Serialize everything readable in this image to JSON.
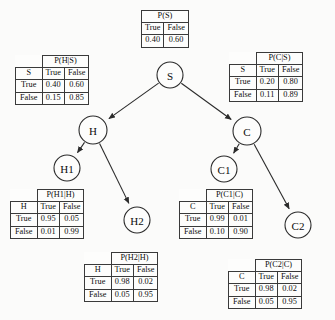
{
  "diagram": {
    "nodes": [
      {
        "id": "S",
        "label": "S",
        "cx": 170,
        "cy": 75,
        "r": 13
      },
      {
        "id": "H",
        "label": "H",
        "cx": 93,
        "cy": 130,
        "r": 14
      },
      {
        "id": "C",
        "label": "C",
        "cx": 247,
        "cy": 131,
        "r": 14
      },
      {
        "id": "H1",
        "label": "H1",
        "cx": 67,
        "cy": 168,
        "r": 13
      },
      {
        "id": "C1",
        "label": "C1",
        "cx": 224,
        "cy": 169,
        "r": 13
      },
      {
        "id": "H2",
        "label": "H2",
        "cx": 137,
        "cy": 220,
        "r": 13
      },
      {
        "id": "C2",
        "label": "C2",
        "cx": 298,
        "cy": 225,
        "r": 13
      }
    ],
    "edges": [
      {
        "from": "S",
        "to": "H"
      },
      {
        "from": "S",
        "to": "C"
      },
      {
        "from": "H",
        "to": "H1"
      },
      {
        "from": "H",
        "to": "H2"
      },
      {
        "from": "C",
        "to": "C1"
      },
      {
        "from": "C",
        "to": "C2"
      }
    ],
    "colors": {
      "stroke": "#2b2b2b",
      "node_fill": "#fdfdfc",
      "table_border": "#3a3a3a",
      "background": "#fbfbfa",
      "text": "#0d0d0d"
    }
  },
  "tables": {
    "p_s": {
      "title": "P(S)",
      "col_headers": [
        "True",
        "False"
      ],
      "values": [
        "0.40",
        "0.60"
      ]
    },
    "p_h_given_s": {
      "title": "P(H|S)",
      "parent_header": "S",
      "col_headers": [
        "True",
        "False"
      ],
      "rows": [
        {
          "label": "True",
          "values": [
            "0.40",
            "0.60"
          ]
        },
        {
          "label": "False",
          "values": [
            "0.15",
            "0.85"
          ]
        }
      ]
    },
    "p_c_given_s": {
      "title": "P(C|S)",
      "parent_header": "S",
      "col_headers": [
        "True",
        "False"
      ],
      "rows": [
        {
          "label": "True",
          "values": [
            "0.20",
            "0.80"
          ]
        },
        {
          "label": "False",
          "values": [
            "0.11",
            "0.89"
          ]
        }
      ]
    },
    "p_h1_given_h": {
      "title": "P(H1|H)",
      "parent_header": "H",
      "col_headers": [
        "True",
        "False"
      ],
      "rows": [
        {
          "label": "True",
          "values": [
            "0.95",
            "0.05"
          ]
        },
        {
          "label": "False",
          "values": [
            "0.01",
            "0.99"
          ]
        }
      ]
    },
    "p_c1_given_c": {
      "title": "P(C1|C)",
      "parent_header": "C",
      "col_headers": [
        "True",
        "False"
      ],
      "rows": [
        {
          "label": "True",
          "values": [
            "0.99",
            "0.01"
          ]
        },
        {
          "label": "False",
          "values": [
            "0.10",
            "0.90"
          ]
        }
      ]
    },
    "p_h2_given_h": {
      "title": "P(H2|H)",
      "parent_header": "H",
      "col_headers": [
        "True",
        "False"
      ],
      "rows": [
        {
          "label": "True",
          "values": [
            "0.98",
            "0.02"
          ]
        },
        {
          "label": "False",
          "values": [
            "0.05",
            "0.95"
          ]
        }
      ]
    },
    "p_c2_given_c": {
      "title": "P(C2|C)",
      "parent_header": "C",
      "col_headers": [
        "True",
        "False"
      ],
      "rows": [
        {
          "label": "True",
          "values": [
            "0.98",
            "0.02"
          ]
        },
        {
          "label": "False",
          "values": [
            "0.05",
            "0.95"
          ]
        }
      ]
    }
  }
}
